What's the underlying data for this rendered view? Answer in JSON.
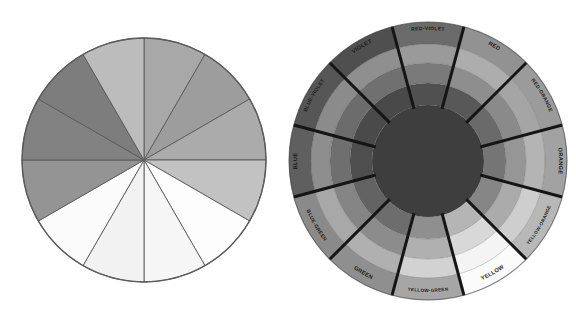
{
  "figure": {
    "background_color": "#ffffff",
    "width": 576,
    "height": 317
  },
  "panels": [
    {
      "id": "tint-shade-pie",
      "name": "twelve-segment-value-wheel",
      "center_x": 144,
      "center_y": 160,
      "radius": 122,
      "outline_color": "#5a5a5a",
      "segment_count": 12,
      "start_angle_deg": -90,
      "segments": [
        {
          "index": 0,
          "label": "segment-1",
          "color": "#a8a8a8",
          "angle_start": -90,
          "angle_end": -60
        },
        {
          "index": 1,
          "label": "segment-2",
          "color": "#9d9d9d",
          "angle_start": -60,
          "angle_end": -30
        },
        {
          "index": 2,
          "label": "segment-3",
          "color": "#ababab",
          "angle_start": -30,
          "angle_end": 0
        },
        {
          "index": 3,
          "label": "segment-4",
          "color": "#c2c2c2",
          "angle_start": 0,
          "angle_end": 30
        },
        {
          "index": 4,
          "label": "segment-5",
          "color": "#fdfdfd",
          "angle_start": 30,
          "angle_end": 60
        },
        {
          "index": 5,
          "label": "segment-6",
          "color": "#f6f6f6",
          "angle_start": 60,
          "angle_end": 90
        },
        {
          "index": 6,
          "label": "segment-7",
          "color": "#f2f2f2",
          "angle_start": 90,
          "angle_end": 120
        },
        {
          "index": 7,
          "label": "segment-8",
          "color": "#fbfbfb",
          "angle_start": 120,
          "angle_end": 150
        },
        {
          "index": 8,
          "label": "segment-9",
          "color": "#949494",
          "angle_start": 150,
          "angle_end": 180
        },
        {
          "index": 9,
          "label": "segment-10",
          "color": "#828282",
          "angle_start": 180,
          "angle_end": 210
        },
        {
          "index": 10,
          "label": "segment-11",
          "color": "#7d7d7d",
          "angle_start": 210,
          "angle_end": 240
        },
        {
          "index": 11,
          "label": "segment-12",
          "color": "#bcbcbc",
          "angle_start": 240,
          "angle_end": 270
        }
      ]
    },
    {
      "id": "labeled-color-wheel",
      "name": "twelve-hue-tint-tone-shade-wheel",
      "center_x": 140,
      "center_y": 161,
      "radius": 139,
      "hub_radius": 56,
      "hub_color": "#3e3e3e",
      "spoke_color": "#151515",
      "spoke_width": 3,
      "rings": [
        {
          "index": 0,
          "name": "hue-ring",
          "inner_radius": 56,
          "outer_radius": 78
        },
        {
          "index": 1,
          "name": "ring-2",
          "inner_radius": 78,
          "outer_radius": 98
        },
        {
          "index": 2,
          "name": "ring-3",
          "inner_radius": 98,
          "outer_radius": 117
        },
        {
          "index": 3,
          "name": "label-ring",
          "inner_radius": 117,
          "outer_radius": 139
        }
      ],
      "hues": [
        {
          "index": 0,
          "label": "RED",
          "angle_start": -75,
          "angle_end": -45,
          "label_angle": -60,
          "ring_colors": [
            "#585858",
            "#8e8e8e",
            "#adadad",
            "#929292"
          ]
        },
        {
          "index": 1,
          "label": "RED-ORANGE",
          "angle_start": -45,
          "angle_end": -15,
          "label_angle": -30,
          "ring_colors": [
            "#6a6a6a",
            "#8a8a8a",
            "#a5a5a5",
            "#9b9b9b"
          ]
        },
        {
          "index": 2,
          "label": "ORANGE",
          "angle_start": -15,
          "angle_end": 15,
          "label_angle": 0,
          "ring_colors": [
            "#757575",
            "#969696",
            "#b4b4b4",
            "#a2a2a2"
          ]
        },
        {
          "index": 3,
          "label": "YELLOW-ORANGE",
          "angle_start": 15,
          "angle_end": 45,
          "label_angle": 30,
          "ring_colors": [
            "#868686",
            "#ababab",
            "#cecece",
            "#b8b8b8"
          ]
        },
        {
          "index": 4,
          "label": "YELLOW",
          "angle_start": 45,
          "angle_end": 75,
          "label_angle": 60,
          "ring_colors": [
            "#b5b5b5",
            "#d8d8d8",
            "#f4f4f4",
            "#fbfbfb"
          ]
        },
        {
          "index": 5,
          "label": "YELLOW-GREEN",
          "angle_start": 75,
          "angle_end": 105,
          "label_angle": 90,
          "ring_colors": [
            "#8f8f8f",
            "#b0b0b0",
            "#d2d2d2",
            "#a6a6a6"
          ]
        },
        {
          "index": 6,
          "label": "GREEN",
          "angle_start": 105,
          "angle_end": 135,
          "label_angle": 120,
          "ring_colors": [
            "#6d6d6d",
            "#8c8c8c",
            "#b0b0b0",
            "#8f8f8f"
          ]
        },
        {
          "index": 7,
          "label": "BLUE-GREEN",
          "angle_start": 135,
          "angle_end": 165,
          "label_angle": 150,
          "ring_colors": [
            "#636363",
            "#858585",
            "#a8a8a8",
            "#8a8a8a"
          ]
        },
        {
          "index": 8,
          "label": "BLUE",
          "angle_start": 165,
          "angle_end": 195,
          "label_angle": 180,
          "ring_colors": [
            "#4e4e4e",
            "#6f6f6f",
            "#8e8e8e",
            "#5f5f5f"
          ]
        },
        {
          "index": 9,
          "label": "BLUE-VIOLET",
          "angle_start": 195,
          "angle_end": 225,
          "label_angle": 210,
          "ring_colors": [
            "#4a4a4a",
            "#6c6c6c",
            "#8b8b8b",
            "#565656"
          ]
        },
        {
          "index": 10,
          "label": "VIOLET",
          "angle_start": 225,
          "angle_end": 255,
          "label_angle": 240,
          "ring_colors": [
            "#494949",
            "#707070",
            "#8f8f8f",
            "#4f4f4f"
          ]
        },
        {
          "index": 11,
          "label": "RED-VIOLET",
          "angle_start": 255,
          "angle_end": 285,
          "label_angle": 270,
          "ring_colors": [
            "#505050",
            "#7a7a7a",
            "#9a9a9a",
            "#6b6b6b"
          ]
        }
      ]
    }
  ]
}
